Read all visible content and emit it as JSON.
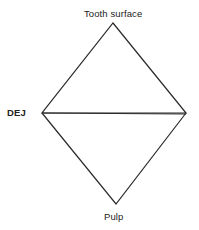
{
  "labels": {
    "top": "Tooth surface",
    "left": "DEJ",
    "bottom": "Pulp"
  },
  "shape": {
    "type": "rhombus-divided",
    "vertices": {
      "top": [
        113,
        23
      ],
      "left": [
        42,
        113
      ],
      "right": [
        186,
        113
      ],
      "bottom": [
        116,
        204
      ]
    },
    "stroke_color": "#2a2a2a",
    "background": "#ffffff"
  }
}
